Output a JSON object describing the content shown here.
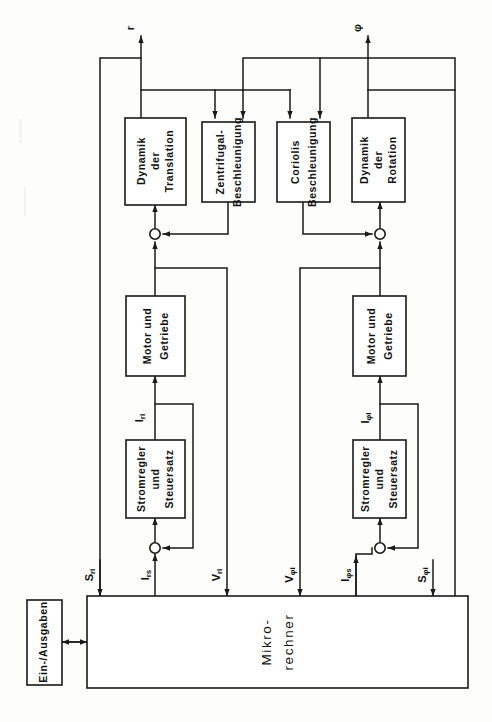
{
  "diagram": {
    "language": "de",
    "orientation": "rotated-90",
    "colors": {
      "line": "#1a1a1a",
      "block_fill": "#ffffff",
      "page_background": "#fdfdfb"
    },
    "blocks": [
      {
        "id": "dynamik-translation",
        "lines": [
          "Dynamik",
          "der",
          "Translation"
        ],
        "x": 125,
        "y": 118,
        "w": 61,
        "h": 87
      },
      {
        "id": "zentrifugal-beschleunigung",
        "lines": [
          "Zentrifugal-",
          "Beschleunigung"
        ],
        "x": 202,
        "y": 122,
        "w": 53,
        "h": 80
      },
      {
        "id": "coriolis-beschleunigung",
        "lines": [
          "Coriolis",
          "Beschleunigung"
        ],
        "x": 277,
        "y": 122,
        "w": 53,
        "h": 80
      },
      {
        "id": "dynamik-rotation",
        "lines": [
          "Dynamik",
          "der",
          "Rotation"
        ],
        "x": 352,
        "y": 118,
        "w": 53,
        "h": 84
      },
      {
        "id": "motor-getriebe-links",
        "lines": [
          "Motor und",
          "Getriebe"
        ],
        "x": 126,
        "y": 296,
        "w": 59,
        "h": 80
      },
      {
        "id": "motor-getriebe-rechts",
        "lines": [
          "Motor und",
          "Getriebe"
        ],
        "x": 353,
        "y": 296,
        "w": 53,
        "h": 80
      },
      {
        "id": "stromregler-links",
        "lines": [
          "Stromregler",
          "und",
          "Steuersatz"
        ],
        "x": 126,
        "y": 440,
        "w": 59,
        "h": 78
      },
      {
        "id": "stromregler-rechts",
        "lines": [
          "Stromregler",
          "und",
          "Steuersatz"
        ],
        "x": 353,
        "y": 440,
        "w": 53,
        "h": 78
      },
      {
        "id": "mikrorechner",
        "lines": [
          "Mikro-",
          "rechner"
        ],
        "x": 87,
        "y": 596,
        "w": 381,
        "h": 92
      },
      {
        "id": "ein-ausgaben",
        "lines": [
          "Ein-/Ausgaben"
        ],
        "x": 27,
        "y": 600,
        "w": 35,
        "h": 85
      }
    ],
    "signals": [
      {
        "id": "r",
        "base": "r",
        "sub": "",
        "x": 141,
        "y": 28
      },
      {
        "id": "phi",
        "base": "φ",
        "sub": "",
        "x": 368,
        "y": 28
      },
      {
        "id": "S_ri",
        "base": "S",
        "sub": "ri",
        "x": 90,
        "y": 575
      },
      {
        "id": "I_rs",
        "base": "I",
        "sub": "rs",
        "x": 146,
        "y": 575
      },
      {
        "id": "V_ri",
        "base": "V",
        "sub": "ri",
        "x": 227,
        "y": 575
      },
      {
        "id": "V_phi",
        "base": "V",
        "sub": "φi",
        "x": 300,
        "y": 575
      },
      {
        "id": "I_phi_s",
        "base": "I",
        "sub": "φs",
        "x": 356,
        "y": 575
      },
      {
        "id": "S_phi",
        "base": "S",
        "sub": "φi",
        "x": 433,
        "y": 575
      },
      {
        "id": "I_ri",
        "base": "I",
        "sub": "ri",
        "x": 148,
        "y": 418
      },
      {
        "id": "I_phi_i",
        "base": "I",
        "sub": "φi",
        "x": 375,
        "y": 418
      }
    ],
    "sum_nodes": [
      {
        "id": "sum-translation",
        "cx": 155,
        "cy": 234
      },
      {
        "id": "sum-rotation",
        "cx": 380,
        "cy": 234
      },
      {
        "id": "sum-strom-links",
        "cx": 155,
        "cy": 548
      },
      {
        "id": "sum-strom-rechts",
        "cx": 380,
        "cy": 548
      }
    ]
  }
}
